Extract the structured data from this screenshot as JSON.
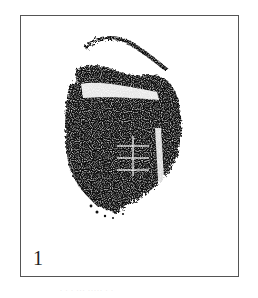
{
  "figure": {
    "panel_label": "1",
    "specimen_description": "ink rubbing / specimen impression",
    "colors": {
      "ink": "#111111",
      "frame": "#555555",
      "background": "#ffffff"
    }
  }
}
